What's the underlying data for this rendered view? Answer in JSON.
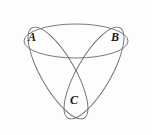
{
  "figure": {
    "background_color": "#fdfdfd",
    "stroke_color": "#6b6b6b",
    "stroke_width": 0.9,
    "label_color": "#1a1a1a",
    "width": 152,
    "height": 135
  },
  "labels": {
    "a": "A",
    "b": "B",
    "c": "C"
  },
  "chart_data": {
    "type": "diagram",
    "diagram_kind": "venn-three-ellipse",
    "center": [
      76,
      62
    ],
    "ellipse_geometry": {
      "semi_major_axis": 52,
      "semi_minor_axis": 17,
      "offset_from_center": 21
    },
    "sets": [
      {
        "name": "A",
        "label": "A",
        "label_position": [
          33,
          37
        ],
        "rotation_degrees": 60,
        "center": [
          58,
          73
        ]
      },
      {
        "name": "B",
        "label": "B",
        "label_position": [
          116,
          37
        ],
        "rotation_degrees": -60,
        "center": [
          94,
          73
        ]
      },
      {
        "name": "C",
        "label": "C",
        "label_position": [
          75,
          100
        ],
        "rotation_degrees": 0,
        "center": [
          76,
          41
        ]
      }
    ],
    "legend": "none",
    "grid": false
  }
}
